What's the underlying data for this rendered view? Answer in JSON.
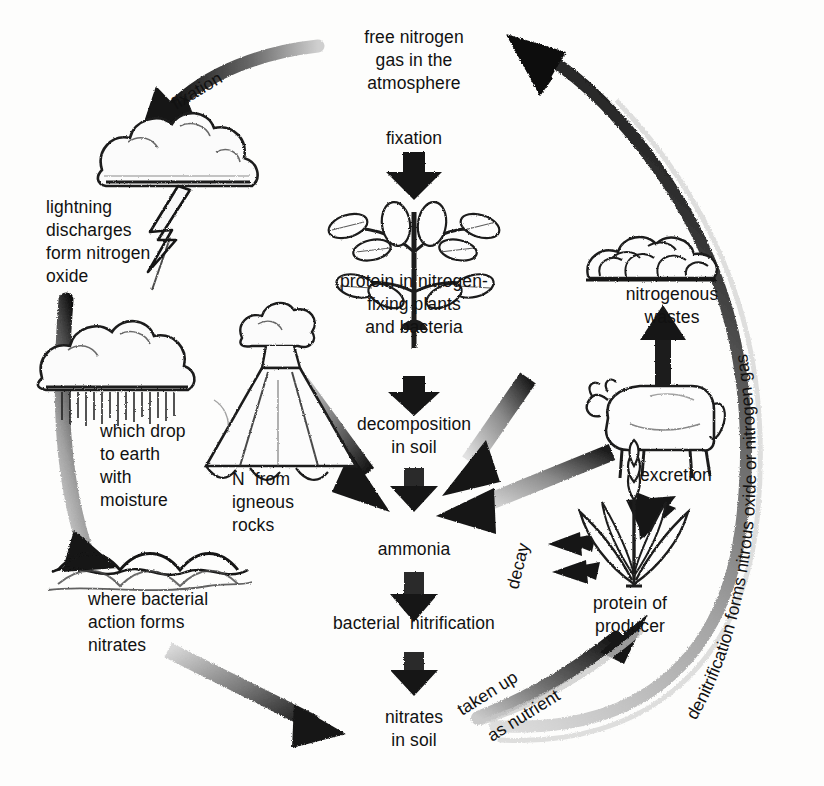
{
  "figure": {
    "type": "cycle-diagram",
    "background_color": "#fdfdfc",
    "ink_color": "#111111"
  },
  "nodes": {
    "free_nitrogen": "free nitrogen\ngas in the\natmosphere",
    "fixation_center": "fixation",
    "protein_plants": "protein in nitrogen-\nfixing plants\nand bacteria",
    "decomposition": "decomposition\nin soil",
    "ammonia": "ammonia",
    "bacterial_nitrification": "bacterial  nitrification",
    "nitrates_in_soil": "nitrates\nin soil",
    "lightning": "lightning\ndischarges\nform nitrogen\noxide",
    "which_drop": "which drop\nto earth\nwith\nmoisture",
    "n_igneous": "N  from\nigneous\nrocks",
    "where_bacterial": "where bacterial\naction forms\nnitrates",
    "nitrogenous_wastes": "nitrogenous\nwastes",
    "excretion": "excretion",
    "protein_producer": "protein of\nproducer"
  },
  "arrow_labels": {
    "fixation_top_left": "fixation",
    "decay": "decay",
    "taken_up": "taken up",
    "as_nutrient": "as nutrient",
    "denitrification": "denitrification forms nitrous oxide or nitrogen gas"
  },
  "pictograms": {
    "cloud_lightning": "storm-cloud-with-lightning",
    "rain_cloud": "rain-cloud",
    "ocean_waves": "ocean-waves",
    "volcano": "volcano",
    "legume_plant": "nitrogen-fixing-plant",
    "manure_pile": "nitrogenous-waste-pile",
    "cow": "cow",
    "grass_producer": "producer-plant"
  },
  "chart_data": {
    "type": "diagram",
    "nodes": [
      "free nitrogen gas in the atmosphere",
      "protein in nitrogen-fixing plants and bacteria",
      "decomposition in soil",
      "ammonia",
      "bacterial nitrification",
      "nitrates in soil",
      "protein of producer",
      "nitrogenous wastes",
      "lightning discharges form nitrogen oxide",
      "which drop to earth with moisture",
      "where bacterial action forms nitrates",
      "N from igneous rocks"
    ],
    "edges": [
      {
        "from": "free nitrogen gas in the atmosphere",
        "to": "protein in nitrogen-fixing plants and bacteria",
        "label": "fixation"
      },
      {
        "from": "free nitrogen gas in the atmosphere",
        "to": "lightning discharges form nitrogen oxide",
        "label": "fixation"
      },
      {
        "from": "lightning discharges form nitrogen oxide",
        "to": "which drop to earth with moisture",
        "label": ""
      },
      {
        "from": "which drop to earth with moisture",
        "to": "where bacterial action forms nitrates",
        "label": ""
      },
      {
        "from": "where bacterial action forms nitrates",
        "to": "nitrates in soil",
        "label": ""
      },
      {
        "from": "protein in nitrogen-fixing plants and bacteria",
        "to": "decomposition in soil",
        "label": ""
      },
      {
        "from": "decomposition in soil",
        "to": "ammonia",
        "label": ""
      },
      {
        "from": "N from igneous rocks",
        "to": "ammonia",
        "label": ""
      },
      {
        "from": "nitrogenous wastes",
        "to": "ammonia",
        "label": ""
      },
      {
        "from": "protein of producer",
        "to": "ammonia",
        "label": "decay"
      },
      {
        "from": "ammonia",
        "to": "bacterial nitrification",
        "label": ""
      },
      {
        "from": "bacterial nitrification",
        "to": "nitrates in soil",
        "label": ""
      },
      {
        "from": "nitrates in soil",
        "to": "protein of producer",
        "label": "taken up as nutrient"
      },
      {
        "from": "protein of producer",
        "to": "nitrogenous wastes",
        "label": "excretion"
      },
      {
        "from": "nitrates in soil",
        "to": "free nitrogen gas in the atmosphere",
        "label": "denitrification forms nitrous oxide or nitrogen gas"
      }
    ]
  }
}
